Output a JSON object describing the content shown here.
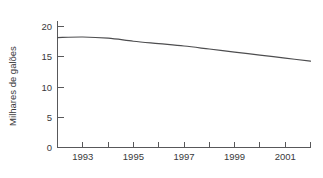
{
  "chart_data": {
    "type": "line",
    "title": "",
    "xlabel": "",
    "ylabel": "Milhares de galões",
    "xlim": [
      1992,
      2002
    ],
    "ylim": [
      0,
      21
    ],
    "grid": false,
    "legend": null,
    "y_ticks": [
      0,
      5,
      10,
      15,
      20
    ],
    "y_tick_labels": [
      "0",
      "5",
      "10",
      "15",
      "20"
    ],
    "x_ticks": [
      1992,
      1993,
      1994,
      1995,
      1996,
      1997,
      1998,
      1999,
      2000,
      2001,
      2002
    ],
    "x_tick_labels": [
      "",
      "1993",
      "",
      "1995",
      "",
      "1997",
      "",
      "1999",
      "",
      "2001",
      ""
    ],
    "x": [
      1992,
      1993,
      1994,
      1995,
      1996,
      1997,
      1998,
      1999,
      2000,
      2001,
      2002
    ],
    "values": [
      18.2,
      18.3,
      18.1,
      17.6,
      17.2,
      16.8,
      16.3,
      15.8,
      15.3,
      14.8,
      14.3
    ],
    "series": [
      {
        "name": "Milhares de galões",
        "color": "#4d4d4f",
        "values": [
          18.2,
          18.3,
          18.1,
          17.6,
          17.2,
          16.8,
          16.3,
          15.8,
          15.3,
          14.8,
          14.3
        ]
      }
    ]
  },
  "axes": {
    "axis_color": "#58585a",
    "line_color": "#4d4d4f",
    "background": "#ffffff"
  }
}
